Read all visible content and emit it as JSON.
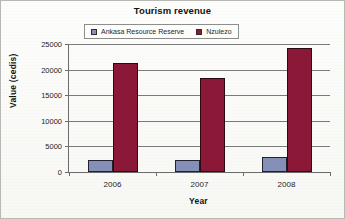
{
  "chart_data": {
    "type": "bar",
    "title": "Tourism revenue",
    "xlabel": "Year",
    "ylabel": "Value (cedis)",
    "categories": [
      "2006",
      "2007",
      "2008"
    ],
    "series": [
      {
        "name": "Ankasa Resource Reserve",
        "color": "#8490b8",
        "values": [
          2400,
          2300,
          2850
        ]
      },
      {
        "name": "Nzulezo",
        "color": "#8c1838",
        "values": [
          21200,
          18400,
          24300
        ]
      }
    ],
    "ylim": [
      0,
      25000
    ],
    "yticks": [
      0,
      5000,
      10000,
      15000,
      20000,
      25000
    ],
    "ytick_labels": [
      "0",
      "5000",
      "10000",
      "15000",
      "20000",
      "25000"
    ],
    "grid": true,
    "legend_position": "top-center"
  }
}
